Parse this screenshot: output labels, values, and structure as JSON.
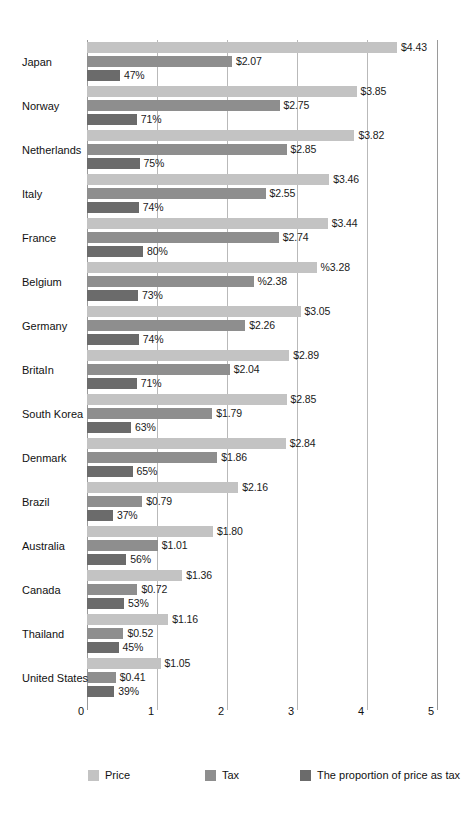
{
  "chart_data": {
    "type": "bar",
    "orientation": "horizontal",
    "title": "",
    "subtitle": "",
    "xlabel": "",
    "ylabel": "",
    "xlim": [
      0,
      5
    ],
    "xticks": [
      "0",
      "1",
      "2",
      "3",
      "4",
      "5"
    ],
    "grid": true,
    "legend_position": "bottom",
    "categories": [
      "Japan",
      "Norway",
      "Netherlands",
      "Italy",
      "France",
      "Belgium",
      "Germany",
      "BritaIn",
      "South Korea",
      "Denmark",
      "Brazil",
      "Australia",
      "Canada",
      "Thailand",
      "United States"
    ],
    "series": [
      {
        "name": "Price",
        "color": "#c3c3c3",
        "values": [
          4.43,
          3.85,
          3.82,
          3.46,
          3.44,
          3.28,
          3.05,
          2.89,
          2.85,
          2.84,
          2.16,
          1.8,
          1.36,
          1.16,
          1.05
        ],
        "labels": [
          "$4.43",
          "$3.85",
          "$3.82",
          "$3.46",
          "$3.44",
          "%3.28",
          "$3.05",
          "$2.89",
          "$2.85",
          "$2.84",
          "$2.16",
          "$1.80",
          "$1.36",
          "$1.16",
          "$1.05"
        ]
      },
      {
        "name": "Tax",
        "color": "#8e8e8e",
        "values": [
          2.07,
          2.75,
          2.85,
          2.55,
          2.74,
          2.38,
          2.26,
          2.04,
          1.79,
          1.86,
          0.79,
          1.01,
          0.72,
          0.52,
          0.41
        ],
        "labels": [
          "$2.07",
          "$2.75",
          "$2.85",
          "$2.55",
          "$2.74",
          "%2.38",
          "$2.26",
          "$2.04",
          "$1.79",
          "$1.86",
          "$0.79",
          "$1.01",
          "$0.72",
          "$0.52",
          "$0.41"
        ]
      },
      {
        "name": "The proportion of price as tax",
        "color": "#6b6b6b",
        "values": [
          0.47,
          0.71,
          0.75,
          0.74,
          0.8,
          0.73,
          0.74,
          0.71,
          0.63,
          0.65,
          0.37,
          0.56,
          0.53,
          0.45,
          0.39
        ],
        "labels": [
          "47%",
          "71%",
          "75%",
          "74%",
          "80%",
          "73%",
          "74%",
          "71%",
          "63%",
          "65%",
          "37%",
          "56%",
          "53%",
          "45%",
          "39%"
        ]
      }
    ]
  },
  "legend": {
    "items": [
      {
        "label": "Price",
        "color": "#c3c3c3"
      },
      {
        "label": "Tax",
        "color": "#8e8e8e"
      },
      {
        "label": "The proportion of price as tax",
        "color": "#6b6b6b"
      }
    ]
  }
}
